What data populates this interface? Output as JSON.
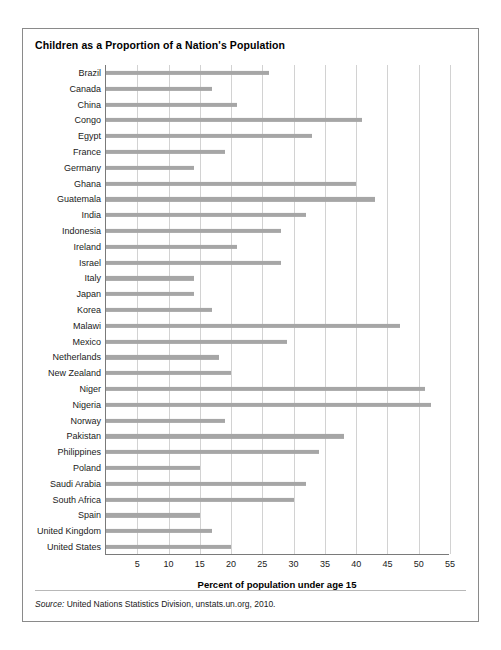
{
  "figure": {
    "title": "Children as a Proportion of a Nation's Population",
    "source_prefix": "Source:",
    "source_text": " United Nations Statistics Division, unstats.un.org, 2010."
  },
  "chart_data": {
    "type": "bar",
    "orientation": "horizontal",
    "title": "Children as a Proportion of a Nation's Population",
    "xlabel": "Percent of population under age 15",
    "ylabel": "",
    "xlim": [
      0,
      55
    ],
    "xticks": [
      5,
      10,
      15,
      20,
      25,
      30,
      35,
      40,
      45,
      50,
      55
    ],
    "grid": "vertical",
    "legend": "none",
    "bar_color": "#a6a6a6",
    "categories": [
      "Brazil",
      "Canada",
      "China",
      "Congo",
      "Egypt",
      "France",
      "Germany",
      "Ghana",
      "Guatemala",
      "India",
      "Indonesia",
      "Ireland",
      "Israel",
      "Italy",
      "Japan",
      "Korea",
      "Malawi",
      "Mexico",
      "Netherlands",
      "New Zealand",
      "Niger",
      "Nigeria",
      "Norway",
      "Pakistan",
      "Philippines",
      "Poland",
      "Saudi Arabia",
      "South Africa",
      "Spain",
      "United Kingdom",
      "United States"
    ],
    "values": [
      26,
      17,
      21,
      41,
      33,
      19,
      14,
      40,
      43,
      32,
      28,
      21,
      28,
      14,
      14,
      17,
      47,
      29,
      18,
      20,
      51,
      52,
      19,
      38,
      34,
      15,
      32,
      30,
      15,
      17,
      20
    ]
  }
}
